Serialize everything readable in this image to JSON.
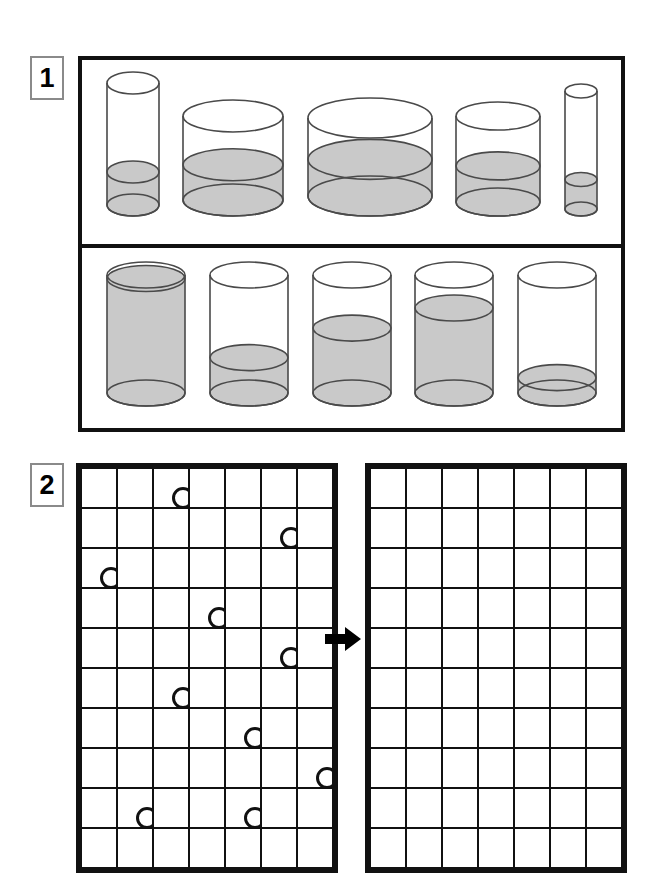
{
  "page": {
    "background_color": "#ffffff",
    "ink_color": "#111111",
    "liquid_color": "#c9c9c9",
    "glass_outline_color": "#4a4a4a"
  },
  "panels": [
    {
      "number": "1",
      "name": "liquid-conservation-panel",
      "rows": [
        {
          "name": "varied-container-row",
          "description": "Five containers of different widths and heights each holding a similar quantity of liquid",
          "containers": [
            {
              "label": "tall-narrow-cylinder",
              "width_px": 52,
              "height_px": 122,
              "ellipse_ry_px": 11,
              "fill_fraction": 0.27,
              "fill_label": "low"
            },
            {
              "label": "medium-wide-cylinder",
              "width_px": 100,
              "height_px": 84,
              "ellipse_ry_px": 16,
              "fill_fraction": 0.42,
              "fill_label": "low-medium"
            },
            {
              "label": "widest-shallow-cylinder",
              "width_px": 124,
              "height_px": 78,
              "ellipse_ry_px": 20,
              "fill_fraction": 0.47,
              "fill_label": "medium"
            },
            {
              "label": "medium-cylinder",
              "width_px": 84,
              "height_px": 86,
              "ellipse_ry_px": 14,
              "fill_fraction": 0.42,
              "fill_label": "low-medium"
            },
            {
              "label": "very-narrow-cylinder",
              "width_px": 32,
              "height_px": 118,
              "ellipse_ry_px": 7,
              "fill_fraction": 0.25,
              "fill_label": "low"
            }
          ]
        },
        {
          "name": "identical-container-row",
          "description": "Five identical containers holding different quantities of liquid",
          "containers": [
            {
              "label": "container-full",
              "width_px": 78,
              "height_px": 118,
              "ellipse_ry_px": 13,
              "fill_fraction": 0.97,
              "fill_label": "full"
            },
            {
              "label": "container-quarter-full",
              "width_px": 78,
              "height_px": 118,
              "ellipse_ry_px": 13,
              "fill_fraction": 0.3,
              "fill_label": "quarter"
            },
            {
              "label": "container-half-full",
              "width_px": 78,
              "height_px": 118,
              "ellipse_ry_px": 13,
              "fill_fraction": 0.55,
              "fill_label": "half"
            },
            {
              "label": "container-three-quarter",
              "width_px": 78,
              "height_px": 118,
              "ellipse_ry_px": 13,
              "fill_fraction": 0.72,
              "fill_label": "three-quarters"
            },
            {
              "label": "container-nearly-empty",
              "width_px": 78,
              "height_px": 118,
              "ellipse_ry_px": 13,
              "fill_fraction": 0.13,
              "fill_label": "nearly-empty"
            }
          ]
        }
      ]
    },
    {
      "number": "2",
      "name": "token-grid-panel",
      "description": "A grid scattered with circular tokens beside an identical empty grid, joined by a right-pointing arrow",
      "grid": {
        "columns": 7,
        "rows": 10,
        "cell_width_px": 34,
        "cell_height_px": 38
      },
      "arrow": {
        "name": "right-arrow",
        "direction": "right",
        "color": "#000000"
      },
      "source_grid": {
        "name": "filled-grid",
        "token_shape": "circle",
        "token_count": 10,
        "tokens": [
          {
            "row": 0,
            "col": 2
          },
          {
            "row": 1,
            "col": 5
          },
          {
            "row": 2,
            "col": 0
          },
          {
            "row": 3,
            "col": 3
          },
          {
            "row": 4,
            "col": 5
          },
          {
            "row": 5,
            "col": 2
          },
          {
            "row": 6,
            "col": 4
          },
          {
            "row": 7,
            "col": 6
          },
          {
            "row": 8,
            "col": 1
          },
          {
            "row": 8,
            "col": 4
          }
        ]
      },
      "target_grid": {
        "name": "empty-grid",
        "token_count": 0,
        "tokens": []
      }
    }
  ]
}
